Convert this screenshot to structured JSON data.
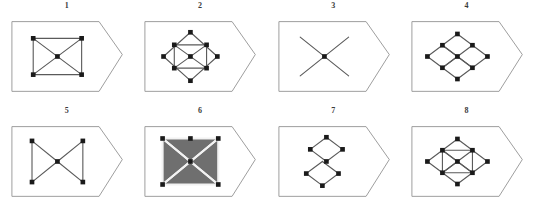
{
  "figure": {
    "type": "diagram-grid",
    "background_color": "#ffffff",
    "line_color": "#5a5a5a",
    "vertex_color": "#1a1a1a",
    "outline_color": "#9a9a9a",
    "columns": 4,
    "rows": 2,
    "panel_count": 8,
    "panels": [
      {
        "number": "1",
        "name": "rectangle-with-diagonals",
        "description": "rectangle with both diagonals crossing, vertices dotted at four corners and center",
        "edges": [
          [
            38,
            38,
            78,
            38
          ],
          [
            78,
            38,
            78,
            68
          ],
          [
            78,
            68,
            38,
            68
          ],
          [
            38,
            68,
            38,
            38
          ],
          [
            38,
            38,
            78,
            68
          ],
          [
            78,
            38,
            38,
            68
          ]
        ],
        "vertices": [
          [
            38,
            38
          ],
          [
            78,
            38
          ],
          [
            78,
            68
          ],
          [
            38,
            68
          ],
          [
            58,
            53
          ]
        ],
        "filled": false
      },
      {
        "number": "2",
        "name": "diamond-over-rectangle-with-diagonals",
        "description": "large wide diamond overlapping an inscribed rectangle with diagonals",
        "edges": [
          [
            18,
            53,
            48,
            26
          ],
          [
            48,
            26,
            78,
            53
          ],
          [
            78,
            53,
            48,
            80
          ],
          [
            48,
            80,
            18,
            53
          ],
          [
            30,
            40,
            66,
            40
          ],
          [
            66,
            40,
            66,
            66
          ],
          [
            66,
            66,
            30,
            66
          ],
          [
            30,
            66,
            30,
            40
          ],
          [
            30,
            40,
            66,
            66
          ],
          [
            66,
            40,
            30,
            66
          ]
        ],
        "vertices": [
          [
            18,
            53
          ],
          [
            48,
            26
          ],
          [
            78,
            53
          ],
          [
            48,
            80
          ],
          [
            30,
            40
          ],
          [
            66,
            40
          ],
          [
            66,
            66
          ],
          [
            30,
            66
          ],
          [
            48,
            53
          ]
        ],
        "filled": false
      },
      {
        "number": "3",
        "name": "crossing-lines-x",
        "description": "two crossing lines forming an X with a center dot only",
        "edges": [
          [
            36,
            36,
            76,
            68
          ],
          [
            76,
            36,
            36,
            68
          ]
        ],
        "vertices": [
          [
            56,
            52
          ]
        ],
        "filled": false
      },
      {
        "number": "4",
        "name": "four-diamond-tiling",
        "description": "four small diamonds tiled in a rhombic 2x2 grid",
        "edges": [
          [
            56,
            24,
            80,
            42
          ],
          [
            80,
            42,
            56,
            60
          ],
          [
            56,
            60,
            32,
            42
          ],
          [
            32,
            42,
            56,
            24
          ],
          [
            80,
            42,
            104,
            60
          ],
          [
            104,
            60,
            80,
            78
          ],
          [
            80,
            78,
            56,
            60
          ],
          [
            32,
            42,
            56,
            60
          ],
          [
            56,
            60,
            32,
            78
          ],
          [
            32,
            78,
            8,
            60
          ],
          [
            8,
            60,
            32,
            42
          ],
          [
            56,
            60,
            80,
            78
          ],
          [
            80,
            78,
            56,
            96
          ],
          [
            56,
            96,
            32,
            78
          ],
          [
            32,
            78,
            56,
            60
          ]
        ],
        "vertices": [
          [
            56,
            24
          ],
          [
            80,
            42
          ],
          [
            32,
            42
          ],
          [
            56,
            60
          ],
          [
            104,
            60
          ],
          [
            8,
            60
          ],
          [
            80,
            78
          ],
          [
            32,
            78
          ],
          [
            56,
            96
          ]
        ],
        "filled": false
      },
      {
        "number": "5",
        "name": "bowtie-hourglass",
        "description": "bowtie/hourglass: two triangles meeting at the center with vertical left and right edges",
        "edges": [
          [
            36,
            36,
            36,
            70
          ],
          [
            78,
            36,
            78,
            70
          ],
          [
            36,
            36,
            57,
            53
          ],
          [
            36,
            70,
            57,
            53
          ],
          [
            78,
            36,
            57,
            53
          ],
          [
            78,
            70,
            57,
            53
          ]
        ],
        "vertices": [
          [
            36,
            36
          ],
          [
            36,
            70
          ],
          [
            78,
            36
          ],
          [
            78,
            70
          ],
          [
            57,
            53
          ]
        ],
        "filled": false
      },
      {
        "number": "6",
        "name": "filled-rectangle-with-bowtie-pattern",
        "description": "dark dense filled rectangle with white X and bowtie pattern inside",
        "edges": [
          [
            34,
            34,
            80,
            34
          ],
          [
            80,
            34,
            80,
            72
          ],
          [
            80,
            72,
            34,
            72
          ],
          [
            34,
            72,
            34,
            34
          ],
          [
            34,
            34,
            80,
            72
          ],
          [
            80,
            34,
            34,
            72
          ],
          [
            34,
            34,
            57,
            53
          ],
          [
            34,
            72,
            57,
            53
          ],
          [
            80,
            34,
            57,
            53
          ],
          [
            80,
            72,
            57,
            53
          ]
        ],
        "vertices": [
          [
            34,
            34
          ],
          [
            57,
            34
          ],
          [
            80,
            34
          ],
          [
            80,
            72
          ],
          [
            34,
            72
          ],
          [
            57,
            53
          ]
        ],
        "filled": true
      },
      {
        "number": "7",
        "name": "two-stacked-diamonds",
        "description": "two diamonds stacked vertically meeting at a single shared vertex",
        "edges": [
          [
            58,
            26,
            82,
            44
          ],
          [
            82,
            44,
            58,
            62
          ],
          [
            58,
            62,
            34,
            44
          ],
          [
            34,
            44,
            58,
            26
          ],
          [
            52,
            62,
            76,
            80
          ],
          [
            76,
            80,
            52,
            98
          ],
          [
            52,
            98,
            28,
            80
          ],
          [
            28,
            80,
            52,
            62
          ]
        ],
        "vertices": [
          [
            58,
            26
          ],
          [
            82,
            44
          ],
          [
            34,
            44
          ],
          [
            58,
            62
          ],
          [
            76,
            80
          ],
          [
            28,
            80
          ],
          [
            52,
            98
          ]
        ],
        "filled": false
      },
      {
        "number": "8",
        "name": "four-diamond-tiling-with-inner-square",
        "description": "four diamonds in rhombic tiling with inner connecting square",
        "edges": [
          [
            58,
            24,
            82,
            42
          ],
          [
            82,
            42,
            58,
            60
          ],
          [
            58,
            60,
            34,
            42
          ],
          [
            34,
            42,
            58,
            24
          ],
          [
            82,
            42,
            106,
            60
          ],
          [
            106,
            60,
            82,
            78
          ],
          [
            82,
            78,
            58,
            60
          ],
          [
            34,
            42,
            58,
            60
          ],
          [
            58,
            60,
            34,
            78
          ],
          [
            34,
            78,
            10,
            60
          ],
          [
            10,
            60,
            34,
            42
          ],
          [
            58,
            60,
            82,
            78
          ],
          [
            82,
            78,
            58,
            96
          ],
          [
            58,
            96,
            34,
            78
          ],
          [
            34,
            78,
            58,
            60
          ],
          [
            34,
            42,
            34,
            78
          ],
          [
            82,
            42,
            82,
            78
          ],
          [
            34,
            42,
            82,
            42
          ],
          [
            34,
            78,
            82,
            78
          ]
        ],
        "vertices": [
          [
            58,
            24
          ],
          [
            82,
            42
          ],
          [
            34,
            42
          ],
          [
            58,
            60
          ],
          [
            106,
            60
          ],
          [
            10,
            60
          ],
          [
            82,
            78
          ],
          [
            34,
            78
          ],
          [
            58,
            96
          ]
        ],
        "filled": false
      }
    ]
  }
}
